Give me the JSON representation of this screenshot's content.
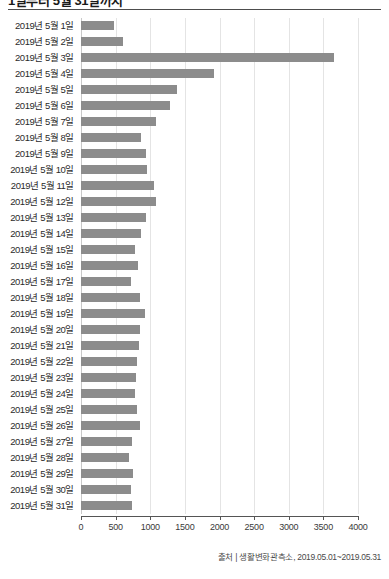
{
  "title": "1일부터 5월 31일까지",
  "source": "출처 | 생활변화관측소, 2019.05.01~2019.05.31",
  "axis": {
    "ticks": [
      0,
      500,
      1000,
      1500,
      2000,
      2500,
      3000,
      3500,
      4000
    ],
    "tick_labels": [
      "0",
      "500",
      "1000",
      "1500",
      "2000",
      "2500",
      "3000",
      "3500",
      "4000"
    ]
  },
  "colors": {
    "bar": "#8c8c8c",
    "grid": "#e4e4e4",
    "axis": "#555555",
    "text": "#2b2b2b"
  },
  "chart_data": {
    "type": "bar",
    "orientation": "horizontal",
    "title": "1일부터 5월 31일까지",
    "xlabel": "",
    "ylabel": "",
    "xlim": [
      0,
      4000
    ],
    "grid": true,
    "legend": false,
    "categories": [
      "2019년 5월 1일",
      "2019년 5월 2일",
      "2019년 5월 3일",
      "2019년 5월 4일",
      "2019년 5월 5일",
      "2019년 5월 6일",
      "2019년 5월 7일",
      "2019년 5월 8일",
      "2019년 5월 9일",
      "2019년 5월 10일",
      "2019년 5월 11일",
      "2019년 5월 12일",
      "2019년 5월 13일",
      "2019년 5월 14일",
      "2019년 5월 15일",
      "2019년 5월 16일",
      "2019년 5월 17일",
      "2019년 5월 18일",
      "2019년 5월 19일",
      "2019년 5월 20일",
      "2019년 5월 21일",
      "2019년 5월 22일",
      "2019년 5월 23일",
      "2019년 5월 24일",
      "2019년 5월 25일",
      "2019년 5월 26일",
      "2019년 5월 27일",
      "2019년 5월 28일",
      "2019년 5월 29일",
      "2019년 5월 30일",
      "2019년 5월 31일"
    ],
    "values": [
      483,
      613,
      3657,
      1917,
      1390,
      1279,
      1087,
      870,
      938,
      952,
      1048,
      1082,
      938,
      870,
      787,
      822,
      725,
      845,
      928,
      859,
      836,
      806,
      797,
      778,
      806,
      855,
      735,
      700,
      749,
      729,
      739
    ]
  }
}
